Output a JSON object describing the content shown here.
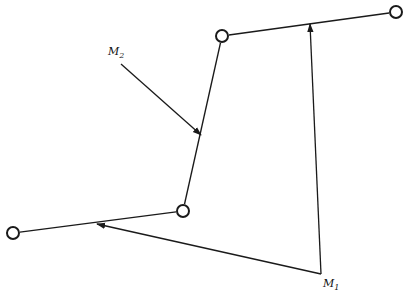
{
  "diagram": {
    "stroke_color": "#1a1a1a",
    "background": "#ffffff",
    "nodes": [
      {
        "id": "A",
        "x": 13,
        "y": 233,
        "r": 6
      },
      {
        "id": "B",
        "x": 183,
        "y": 211,
        "r": 6
      },
      {
        "id": "C",
        "x": 222,
        "y": 36,
        "r": 6
      },
      {
        "id": "D",
        "x": 396,
        "y": 12,
        "r": 6
      }
    ],
    "segments": [
      {
        "from": "A",
        "to": "B"
      },
      {
        "from": "B",
        "to": "C"
      },
      {
        "from": "C",
        "to": "D"
      }
    ],
    "arrows": [
      {
        "name": "m2-arrow",
        "x1": 121,
        "y1": 64,
        "x2": 201,
        "y2": 135
      },
      {
        "name": "m1-to-cd-arrow",
        "x1": 321,
        "y1": 274,
        "x2": 310,
        "y2": 24
      },
      {
        "name": "m1-to-ab-arrow",
        "x1": 321,
        "y1": 274,
        "x2": 97,
        "y2": 224
      }
    ],
    "labels": [
      {
        "name": "label-m2",
        "main": "M",
        "sub": "2",
        "x": 108,
        "y": 55
      },
      {
        "name": "label-m1",
        "main": "M",
        "sub": "1",
        "x": 323,
        "y": 287
      }
    ]
  }
}
